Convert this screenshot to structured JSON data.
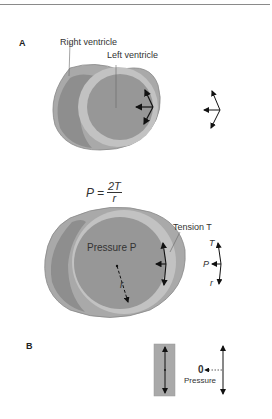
{
  "panels": {
    "a": {
      "label": "A"
    },
    "b": {
      "label": "B"
    }
  },
  "labels": {
    "right_ventricle": "Right ventricle",
    "left_ventricle": "Left ventricle",
    "pressure": "Pressure P",
    "tension": "Tension  T",
    "radius": "r",
    "vector_T": "T",
    "vector_P": "P",
    "vector_r": "r",
    "zero": "0",
    "pressure_b": "Pressure"
  },
  "formula": {
    "lhs": "P =",
    "numerator": "2T",
    "denominator": "r"
  },
  "colors": {
    "outer_wall": "#a9a9a9",
    "rv_cavity": "#8e8e8e",
    "lv_wall": "#c2c2c2",
    "lv_cavity": "#979797",
    "arrow": "#111111"
  }
}
